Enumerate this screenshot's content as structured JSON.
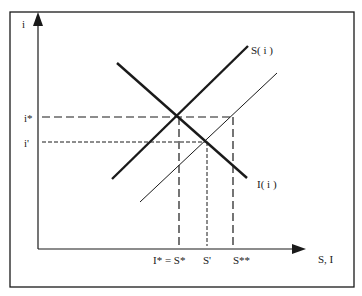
{
  "diagram": {
    "type": "savings-investment equilibrium",
    "axes": {
      "y_label": "i",
      "x_label": "S, I"
    },
    "curves": {
      "saving": "S( i )",
      "saving_shifted": "S'( i )",
      "investment": "I( i )"
    },
    "y_ticks": {
      "i_star": "i*",
      "i_prime": "i'"
    },
    "x_ticks": {
      "equilibrium": "I* = S*",
      "s_prime": "S'",
      "s_double_star": "S**"
    },
    "colors": {
      "line": "#1a1a1a",
      "frame": "#1a1a1a",
      "background": "#ffffff"
    }
  }
}
